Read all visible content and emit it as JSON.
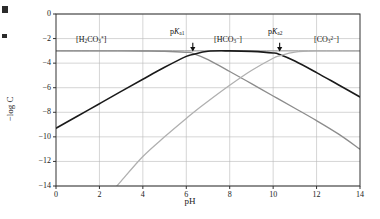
{
  "figure": {
    "kind": "log-concentration-diagram"
  },
  "chart_data": {
    "type": "line",
    "title": "",
    "xlabel": "pH",
    "ylabel": "−log C",
    "xlim": [
      0,
      14
    ],
    "ylim": [
      -14,
      0
    ],
    "xticks": [
      0,
      2,
      4,
      6,
      8,
      10,
      12,
      14
    ],
    "yticks": [
      0,
      -2,
      -4,
      -6,
      -8,
      -10,
      -12,
      -14
    ],
    "xtick_labels": [
      "0",
      "2",
      "4",
      "6",
      "8",
      "10",
      "12",
      "14"
    ],
    "ytick_labels": [
      "0",
      "−2",
      "−4",
      "−6",
      "−8",
      "−10",
      "−12",
      "−14"
    ],
    "grid": true,
    "legend_position": "inline-annotations",
    "total_CT": -3.0,
    "pKa1": 6.3,
    "pKa2": 10.3,
    "series": [
      {
        "name": "CT",
        "label": "total carbonate",
        "color": "#8c8c8c",
        "width": 1.0,
        "x": [
          0,
          14
        ],
        "y": [
          -3.0,
          -3.0
        ]
      },
      {
        "name": "H2CO3",
        "label": "[H2CO3*]",
        "color": "#8c8c8c",
        "width": 1.3,
        "x": [
          0,
          1,
          2,
          3,
          4,
          5,
          6,
          6.3,
          7,
          8,
          9,
          10,
          10.3,
          11,
          12,
          13,
          14
        ],
        "y": [
          -3.0,
          -3.0,
          -3.0,
          -3.0,
          -3.01,
          -3.03,
          -3.12,
          -3.2,
          -3.72,
          -4.68,
          -5.67,
          -6.67,
          -6.97,
          -7.67,
          -8.68,
          -9.76,
          -11.0
        ]
      },
      {
        "name": "HCO3",
        "label": "[HCO3-]",
        "color": "#1a1a1a",
        "width": 1.6,
        "x": [
          0,
          1,
          2,
          3,
          4,
          5,
          6,
          6.3,
          7,
          8,
          9,
          10,
          10.3,
          11,
          12,
          13,
          14
        ],
        "y": [
          -9.3,
          -8.3,
          -7.3,
          -6.3,
          -5.31,
          -4.34,
          -3.45,
          -3.3,
          -3.03,
          -3.0,
          -3.04,
          -3.17,
          -3.3,
          -3.83,
          -4.77,
          -5.76,
          -6.75
        ]
      },
      {
        "name": "CO3",
        "label": "[CO3 2-]",
        "color": "#b0b0b0",
        "width": 1.3,
        "x": [
          2.8,
          3,
          4,
          5,
          6,
          6.3,
          7,
          8,
          9,
          10,
          10.3,
          11,
          12,
          13,
          14
        ],
        "y": [
          -14.0,
          -13.6,
          -11.6,
          -10.0,
          -8.5,
          -8.05,
          -7.1,
          -5.8,
          -4.6,
          -3.6,
          -3.4,
          -3.1,
          -3.0,
          -3.0,
          -3.0
        ]
      }
    ],
    "species_labels": [
      {
        "id": "h2co3",
        "html": "[H<sub>2</sub>CO<sub>3</sub><sup>*</sup>]",
        "x_px": 76,
        "y_px": 35
      },
      {
        "id": "hco3",
        "html": "[HCO<sub>3</sub><sup>−</sup>]",
        "x_px": 214,
        "y_px": 35
      },
      {
        "id": "co3",
        "html": "[CO<sub>3</sub><sup>2−</sup>]",
        "x_px": 314,
        "y_px": 35
      }
    ],
    "annotations": [
      {
        "id": "pka1",
        "html": "p<i>K</i><sub>a1</sub>",
        "x_value": 6.3,
        "label_x_px": 170,
        "label_y_px": 27
      },
      {
        "id": "pka2",
        "html": "p<i>K</i><sub>a2</sub>",
        "x_value": 10.3,
        "label_x_px": 268,
        "label_y_px": 27
      }
    ]
  }
}
